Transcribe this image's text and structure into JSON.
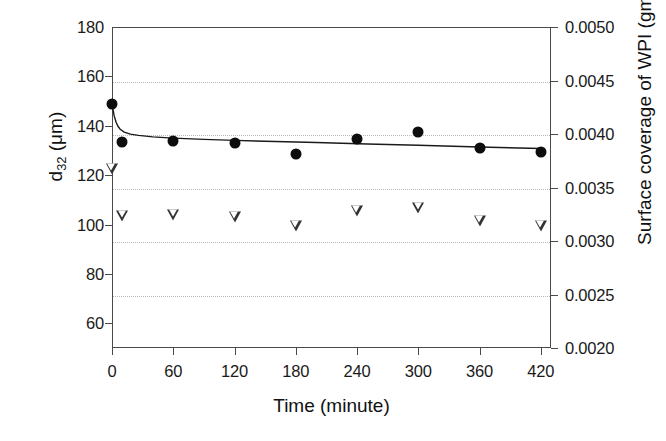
{
  "chart_data": {
    "type": "scatter",
    "title": "",
    "xlabel": "Time (minute)",
    "ylabel": "d32 (μm)",
    "ylabel_right": "Surface coverage of WPI (gm-2)",
    "xlim": [
      0,
      430
    ],
    "ylim": [
      50,
      180
    ],
    "ylim_right": [
      0.002,
      0.005
    ],
    "grid": true,
    "legend": "none",
    "xticks": [
      "0",
      "60",
      "120",
      "180",
      "240",
      "300",
      "360",
      "420"
    ],
    "xtick_values": [
      0,
      60,
      120,
      180,
      240,
      300,
      360,
      420
    ],
    "yticks": [
      "180",
      "160",
      "140",
      "120",
      "100",
      "80",
      "60"
    ],
    "ytick_values": [
      180,
      160,
      140,
      120,
      100,
      80,
      60
    ],
    "yticks_right": [
      "0.0050",
      "0.0045",
      "0.0040",
      "0.0035",
      "0.0030",
      "0.0025",
      "0.0020"
    ],
    "ytick_values_right": [
      0.005,
      0.0045,
      0.004,
      0.0035,
      0.003,
      0.0025,
      0.002
    ],
    "gridline_values_right": [
      0.0045,
      0.004,
      0.0035,
      0.003,
      0.0025
    ],
    "series": [
      {
        "name": "d32 droplet size",
        "marker": "filled-circle",
        "axis": "left",
        "color": "#0d0d0d",
        "x": [
          0,
          10,
          60,
          120,
          180,
          240,
          300,
          360,
          420
        ],
        "y": [
          149.0,
          133.5,
          134.0,
          133.0,
          128.5,
          134.5,
          137.5,
          131.0,
          129.5
        ]
      },
      {
        "name": "Surface coverage of WPI",
        "marker": "open-triangle-down",
        "axis": "right",
        "color": "#333333",
        "x": [
          0,
          10,
          60,
          120,
          180,
          240,
          300,
          360,
          420
        ],
        "y": [
          0.00368,
          0.00324,
          0.00325,
          0.00323,
          0.00315,
          0.00329,
          0.00332,
          0.0032,
          0.00315
        ]
      }
    ],
    "fitted_curves": [
      {
        "name": "d32 fitted decay curve",
        "axis": "left",
        "color": "#1a1a1a",
        "x": [
          0,
          2,
          4,
          6,
          8,
          12,
          18,
          26,
          40,
          60,
          90,
          120,
          160,
          200,
          250,
          300,
          360,
          420
        ],
        "y": [
          149.0,
          144.2,
          141.4,
          139.7,
          138.6,
          137.4,
          136.6,
          136.1,
          135.5,
          135.0,
          134.5,
          134.1,
          133.6,
          133.2,
          132.6,
          132.1,
          131.4,
          130.8
        ]
      }
    ]
  },
  "axes": {
    "left_title": {
      "pre": "d",
      "sub": "32",
      "post": " (μm)"
    },
    "right_title": {
      "pre": "Surface coverage of WPI (gm",
      "sup": "-2",
      "post": ")"
    },
    "x_title": "Time (minute)"
  }
}
